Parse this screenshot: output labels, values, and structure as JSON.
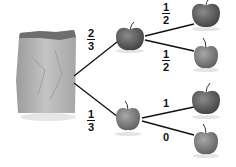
{
  "diagram": {
    "type": "probability-tree",
    "root": {
      "label": "bag"
    },
    "branches": [
      {
        "prob_num": "2",
        "prob_den": "3",
        "node": "apple",
        "children": [
          {
            "prob_num": "1",
            "prob_den": "2",
            "node": "apple"
          },
          {
            "prob_num": "1",
            "prob_den": "2",
            "node": "apple"
          }
        ]
      },
      {
        "prob_num": "1",
        "prob_den": "3",
        "node": "apple",
        "children": [
          {
            "prob": "1",
            "node": "apple"
          },
          {
            "prob": "0",
            "node": "apple"
          }
        ]
      }
    ]
  },
  "colors": {
    "line": "#111111",
    "apple_dark": "#5a5a5a",
    "apple_light": "#8a8a8a",
    "bag": "#b8b8b8"
  }
}
